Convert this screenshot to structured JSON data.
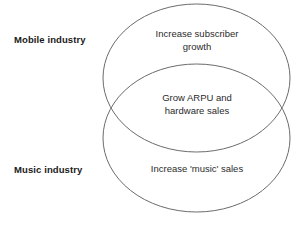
{
  "diagram": {
    "type": "venn",
    "title": "",
    "background_color": "#ffffff",
    "stroke_color": "#6b6b6b",
    "text_color": "#2b2b2b",
    "label_color": "#1a1a1a",
    "sets": [
      {
        "name": "mobile-industry",
        "label": "Mobile industry",
        "exclusive_text_lines": [
          "Increase subscriber",
          "growth"
        ]
      },
      {
        "name": "music-industry",
        "label": "Music industry",
        "exclusive_text_lines": [
          "Increase 'music' sales"
        ]
      }
    ],
    "intersection": {
      "name": "mobile-music-overlap",
      "text_lines": [
        "Grow ARPU and",
        "hardware sales"
      ]
    },
    "footer_note": ""
  }
}
